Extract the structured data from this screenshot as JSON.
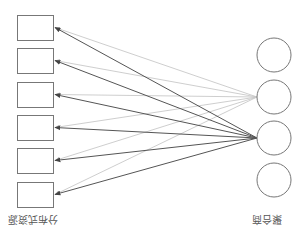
{
  "diagram": {
    "title": "",
    "orientation_note": "rendered rotated 180 degrees",
    "left_group": {
      "label": "分布式资源",
      "node_shape": "rectangle",
      "nodes": [
        {
          "id": "r1",
          "x": 17,
          "y": 15,
          "w": 36,
          "h": 25
        },
        {
          "id": "r2",
          "x": 17,
          "y": 48,
          "w": 36,
          "h": 25
        },
        {
          "id": "r3",
          "x": 17,
          "y": 82,
          "w": 36,
          "h": 25
        },
        {
          "id": "r4",
          "x": 17,
          "y": 115,
          "w": 36,
          "h": 25
        },
        {
          "id": "r5",
          "x": 17,
          "y": 148,
          "w": 36,
          "h": 25
        },
        {
          "id": "r6",
          "x": 17,
          "y": 182,
          "w": 36,
          "h": 25
        }
      ]
    },
    "right_group": {
      "label": "聚合商",
      "node_shape": "circle",
      "nodes": [
        {
          "id": "c1",
          "cx": 274,
          "cy": 55,
          "r": 17
        },
        {
          "id": "c2",
          "cx": 274,
          "cy": 97,
          "r": 17
        },
        {
          "id": "c3",
          "cx": 274,
          "cy": 138,
          "r": 17
        },
        {
          "id": "c4",
          "cx": 274,
          "cy": 180,
          "r": 17
        }
      ]
    },
    "edges": [
      {
        "from": "c2",
        "to": "r1",
        "style": "light"
      },
      {
        "from": "c2",
        "to": "r2",
        "style": "light"
      },
      {
        "from": "c2",
        "to": "r3",
        "style": "light"
      },
      {
        "from": "c2",
        "to": "r4",
        "style": "light"
      },
      {
        "from": "c2",
        "to": "r5",
        "style": "light"
      },
      {
        "from": "c2",
        "to": "r6",
        "style": "light"
      },
      {
        "from": "c3",
        "to": "r1",
        "style": "dark"
      },
      {
        "from": "c3",
        "to": "r2",
        "style": "dark"
      },
      {
        "from": "c3",
        "to": "r3",
        "style": "dark"
      },
      {
        "from": "c3",
        "to": "r4",
        "style": "dark"
      },
      {
        "from": "c3",
        "to": "r5",
        "style": "dark"
      },
      {
        "from": "c3",
        "to": "r6",
        "style": "dark"
      }
    ],
    "colors": {
      "node_stroke": "#777777",
      "edge_light": "#c8c8c8",
      "edge_dark": "#555555",
      "label": "#555555"
    }
  }
}
